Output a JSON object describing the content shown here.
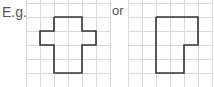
{
  "labels": {
    "example": "E.g.",
    "or": "or"
  },
  "grid": {
    "cell_size": 14,
    "line_color": "#d9d9d9",
    "shape_color": "#333333"
  },
  "figures": [
    {
      "name": "cross-shape",
      "grid_origin": [
        26,
        3
      ],
      "columns": 6,
      "rows": 6,
      "outline_points": "54,17 82,17 82,31 96,31 96,45 82,45 82,73 54,73 54,45 40,45 40,31 54,31"
    },
    {
      "name": "l-shape",
      "grid_origin": [
        128,
        3
      ],
      "columns": 6,
      "rows": 6,
      "outline_points": "156,17 198,17 198,45 184,45 184,73 156,73"
    }
  ]
}
